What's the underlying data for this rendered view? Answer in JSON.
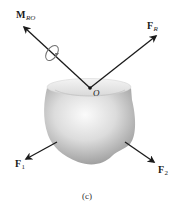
{
  "figure": {
    "caption": "(c)",
    "point": {
      "label": "O"
    },
    "vectors": [
      {
        "id": "moment",
        "symbol": "M",
        "subscript": "RO",
        "kind": "couple-moment"
      },
      {
        "id": "resultant",
        "symbol": "F",
        "subscript": "R",
        "kind": "force"
      },
      {
        "id": "f1",
        "symbol": "F",
        "subscript": "1",
        "kind": "force"
      },
      {
        "id": "f2",
        "symbol": "F",
        "subscript": "2",
        "kind": "force"
      }
    ],
    "colors": {
      "arrow": "#1a1a1a",
      "body_light": "#f2f2f2",
      "body_dark": "#8c8c8c",
      "moment_ring": "#6e6e6e"
    }
  }
}
